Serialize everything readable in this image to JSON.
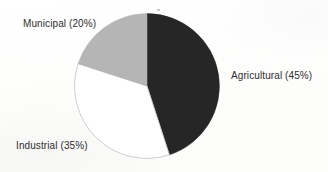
{
  "figure": {
    "background_color": "#fdfdfd",
    "label_color": "#2e2e2e"
  },
  "chart_data": {
    "type": "pie",
    "title": "",
    "subtitle": "",
    "xlabel": "",
    "ylabel": "",
    "grid": false,
    "legend_position": "none",
    "labels_position": "outside-callout",
    "start_angle_deg": 0,
    "direction": "clockwise",
    "total_percent": 100,
    "categories": [
      "Agricultural",
      "Industrial",
      "Municipal"
    ],
    "values": [
      45,
      35,
      20
    ],
    "units": "percent",
    "slices": [
      {
        "name": "Agricultural",
        "value": 45,
        "percent_text": "45%",
        "label_text": "Agricultural (45%)",
        "color": "#262626",
        "stroke": "#262626",
        "start_angle_deg": 0,
        "end_angle_deg": 162
      },
      {
        "name": "Industrial",
        "value": 35,
        "percent_text": "35%",
        "label_text": "Industrial (35%)",
        "color": "#ffffff",
        "stroke": "#c8c8c8",
        "start_angle_deg": 162,
        "end_angle_deg": 288
      },
      {
        "name": "Municipal",
        "value": 20,
        "percent_text": "20%",
        "label_text": "Municipal (20%)",
        "color": "#b5b5b5",
        "stroke": "#b5b5b5",
        "start_angle_deg": 288,
        "end_angle_deg": 360
      }
    ],
    "annotations": []
  }
}
